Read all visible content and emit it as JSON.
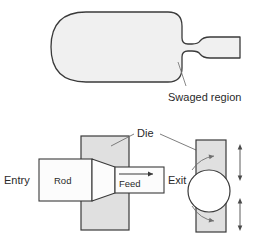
{
  "figure": {
    "background_color": "#ffffff",
    "outline_color": "#3a3a3a",
    "workpiece_fill": "#f0f0f0",
    "die_fill": "#e0e0e0",
    "rod_fill": "#fcfcfc",
    "text_color": "#2a2a2a"
  },
  "upper_view": {
    "name": "swaged workpiece profile",
    "labels": {
      "swaged_region": "Swaged region"
    }
  },
  "lower_view": {
    "name": "swaging die and rod section",
    "labels": {
      "entry": "Entry",
      "exit": "Exit",
      "rod": "Rod",
      "feed": "Feed",
      "die": "Die"
    }
  }
}
